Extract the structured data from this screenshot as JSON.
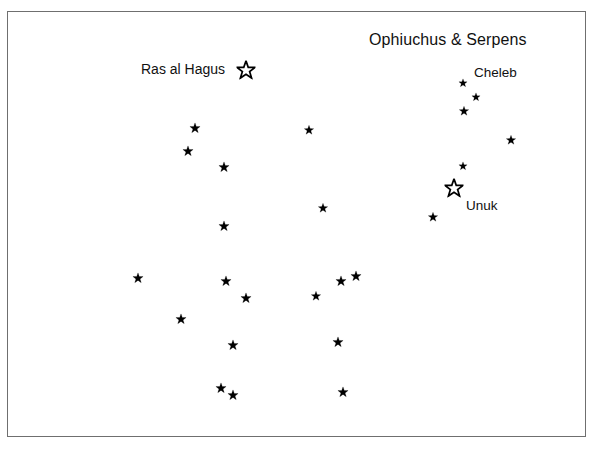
{
  "chart": {
    "title": "Ophiuchus & Serpens",
    "kind": "star-chart",
    "background_color": "#ffffff",
    "ink_color": "#000000",
    "frame_color": "#6f6f6f"
  },
  "labels": [
    {
      "id": "title",
      "text": "Ophiuchus & Serpens",
      "x": 369,
      "y": 31
    },
    {
      "id": "ras-al-hagus",
      "text": "Ras al Hagus",
      "x": 141,
      "y": 61
    },
    {
      "id": "cheleb",
      "text": "Cheleb",
      "x": 474,
      "y": 65
    },
    {
      "id": "unuk",
      "text": "Unuk",
      "x": 466,
      "y": 198
    }
  ],
  "chart_data": {
    "type": "scatter",
    "title": "Ophiuchus & Serpens",
    "xlabel": "",
    "ylabel": "",
    "grid": false,
    "legend": "none",
    "xlim": [
      7,
      586
    ],
    "ylim": [
      11,
      437
    ],
    "marker": "star",
    "named_stars": [
      {
        "name": "Ras al Hagus",
        "x": 246,
        "y": 70,
        "style": "open",
        "size": 19
      },
      {
        "name": "Cheleb",
        "x": 463,
        "y": 83,
        "style": "filled",
        "size": 9
      },
      {
        "name": "Unuk",
        "x": 454,
        "y": 188,
        "style": "open",
        "size": 19
      }
    ],
    "stars": [
      {
        "x": 246,
        "y": 70,
        "style": "open",
        "size": 19,
        "name": "Ras al Hagus"
      },
      {
        "x": 463,
        "y": 83,
        "style": "filled",
        "size": 9,
        "name": "Cheleb"
      },
      {
        "x": 476,
        "y": 97,
        "style": "filled",
        "size": 9,
        "name": ""
      },
      {
        "x": 464,
        "y": 111,
        "style": "filled",
        "size": 10,
        "name": ""
      },
      {
        "x": 195,
        "y": 128,
        "style": "filled",
        "size": 11,
        "name": ""
      },
      {
        "x": 309,
        "y": 130,
        "style": "filled",
        "size": 10,
        "name": ""
      },
      {
        "x": 511,
        "y": 140,
        "style": "filled",
        "size": 10,
        "name": ""
      },
      {
        "x": 188,
        "y": 151,
        "style": "filled",
        "size": 11,
        "name": ""
      },
      {
        "x": 463,
        "y": 166,
        "style": "filled",
        "size": 9,
        "name": ""
      },
      {
        "x": 224,
        "y": 167,
        "style": "filled",
        "size": 11,
        "name": ""
      },
      {
        "x": 454,
        "y": 188,
        "style": "open",
        "size": 19,
        "name": "Unuk"
      },
      {
        "x": 323,
        "y": 208,
        "style": "filled",
        "size": 10,
        "name": ""
      },
      {
        "x": 433,
        "y": 217,
        "style": "filled",
        "size": 10,
        "name": ""
      },
      {
        "x": 224,
        "y": 226,
        "style": "filled",
        "size": 11,
        "name": ""
      },
      {
        "x": 356,
        "y": 276,
        "style": "filled",
        "size": 11,
        "name": ""
      },
      {
        "x": 138,
        "y": 278,
        "style": "filled",
        "size": 11,
        "name": ""
      },
      {
        "x": 341,
        "y": 281,
        "style": "filled",
        "size": 11,
        "name": ""
      },
      {
        "x": 226,
        "y": 281,
        "style": "filled",
        "size": 11,
        "name": ""
      },
      {
        "x": 316,
        "y": 296,
        "style": "filled",
        "size": 10,
        "name": ""
      },
      {
        "x": 246,
        "y": 298,
        "style": "filled",
        "size": 11,
        "name": ""
      },
      {
        "x": 181,
        "y": 319,
        "style": "filled",
        "size": 11,
        "name": ""
      },
      {
        "x": 233,
        "y": 345,
        "style": "filled",
        "size": 11,
        "name": ""
      },
      {
        "x": 338,
        "y": 342,
        "style": "filled",
        "size": 11,
        "name": ""
      },
      {
        "x": 221,
        "y": 388,
        "style": "filled",
        "size": 11,
        "name": ""
      },
      {
        "x": 343,
        "y": 392,
        "style": "filled",
        "size": 11,
        "name": ""
      },
      {
        "x": 233,
        "y": 395,
        "style": "filled",
        "size": 11,
        "name": ""
      }
    ]
  }
}
